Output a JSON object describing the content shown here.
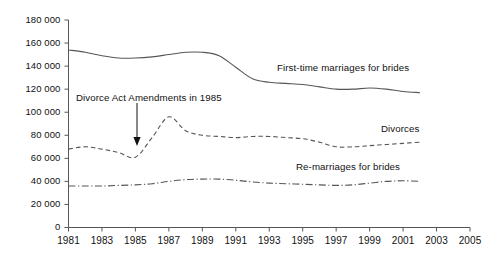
{
  "chart_data": {
    "type": "line",
    "title": "",
    "xlabel": "",
    "ylabel": "",
    "xlim": [
      1981,
      2005
    ],
    "ylim": [
      0,
      180000
    ],
    "grid": false,
    "legend_position": "inline-labels",
    "x_ticks": [
      "1981",
      "1983",
      "1985",
      "1987",
      "1989",
      "1991",
      "1993",
      "1995",
      "1997",
      "1999",
      "2001",
      "2003",
      "2005"
    ],
    "x_tick_values": [
      1981,
      1983,
      1985,
      1987,
      1989,
      1991,
      1993,
      1995,
      1997,
      1999,
      2001,
      2003,
      2005
    ],
    "y_ticks": [
      "0",
      "20 000",
      "40 000",
      "60 000",
      "80 000",
      "100 000",
      "120 000",
      "140 000",
      "160 000",
      "180 000"
    ],
    "y_tick_values": [
      0,
      20000,
      40000,
      60000,
      80000,
      100000,
      120000,
      140000,
      160000,
      180000
    ],
    "x": [
      1981,
      1982,
      1983,
      1984,
      1985,
      1986,
      1987,
      1988,
      1989,
      1990,
      1991,
      1992,
      1993,
      1994,
      1995,
      1996,
      1997,
      1998,
      1999,
      2000,
      2001,
      2002
    ],
    "series": [
      {
        "name": "First-time marriages for brides",
        "style": "solid",
        "color": "#55565a",
        "values": [
          154000,
          152000,
          149000,
          147000,
          147000,
          148000,
          150000,
          152000,
          152000,
          149000,
          139000,
          129000,
          126000,
          125000,
          124000,
          122000,
          120000,
          120000,
          121000,
          120000,
          118000,
          117000
        ]
      },
      {
        "name": "Divorces",
        "style": "dashed",
        "color": "#55565a",
        "values": [
          68000,
          70000,
          68000,
          65000,
          61000,
          78000,
          96000,
          84000,
          80000,
          79000,
          78000,
          79000,
          79000,
          78000,
          77000,
          74000,
          70000,
          70000,
          71000,
          72000,
          73000,
          74000
        ]
      },
      {
        "name": "Re-marriages for brides",
        "style": "dashdot",
        "color": "#55565a",
        "values": [
          36000,
          36000,
          36000,
          36500,
          37000,
          38000,
          40000,
          41500,
          42000,
          42000,
          41000,
          39500,
          38500,
          38000,
          37500,
          37000,
          36500,
          37000,
          38500,
          40000,
          40500,
          40000
        ]
      }
    ],
    "annotations": [
      {
        "text": "Divorce Act Amendments in 1985",
        "points_to_x": 1985,
        "points_to_y": 62000,
        "arrow": "down"
      }
    ],
    "series_labels": [
      {
        "text": "First-time marriages for brides"
      },
      {
        "text": "Divorces"
      },
      {
        "text": "Re-marriages for brides"
      }
    ]
  },
  "axis_color": "#55565a"
}
